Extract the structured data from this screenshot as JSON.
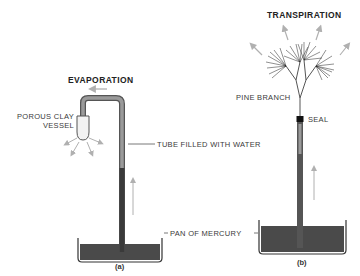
{
  "panel_a": {
    "title": "EVAPORATION",
    "vessel_label_line1": "POROUS CLAY",
    "vessel_label_line2": "VESSEL",
    "caption": "(a)"
  },
  "panel_b": {
    "title": "TRANSPIRATION",
    "branch_label": "PINE BRANCH",
    "seal_label": "SEAL",
    "caption": "(b)"
  },
  "shared_labels": {
    "tube": "TUBE FILLED WITH WATER",
    "pan": "PAN OF MERCURY"
  },
  "colors": {
    "mercury": "#4a4a4a",
    "water": "#9a9a9a",
    "tube_outline": "#333333",
    "arrow": "#b0b0b0",
    "seal": "#111111"
  }
}
